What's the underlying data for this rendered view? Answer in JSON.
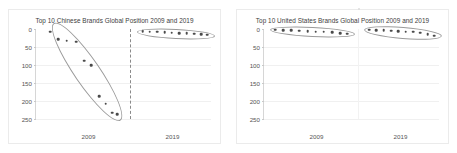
{
  "figure": {
    "background_color": "#ffffff",
    "panel_border_color": "#ebebeb",
    "point_color": "#4a4a4a",
    "ellipse_color": "#9a9a9a",
    "divider_color": "#8a8a8a"
  },
  "charts": [
    {
      "id": "chinese-brands",
      "title": "Top 10 Chinese Brands Global Position 2009 and 2019",
      "xticks": [
        "2009",
        "2019"
      ],
      "yticks": [
        "0",
        "50",
        "100",
        "150",
        "200",
        "250"
      ]
    },
    {
      "id": "united-states-brands",
      "title": "Top 10 United States Brands Global Position 2009 and 2019",
      "xticks": [
        "2009",
        "2019"
      ],
      "yticks": [
        "0",
        "50",
        "100",
        "150",
        "200",
        "250"
      ]
    }
  ],
  "chart_data": [
    {
      "type": "scatter",
      "title": "Top 10 Chinese Brands Global Position 2009 and 2019",
      "xlabel": "",
      "ylabel": "",
      "ylim": [
        0,
        250
      ],
      "y_inverted": true,
      "grid": true,
      "legend": "none",
      "categories": [
        "2009",
        "2019"
      ],
      "series": [
        {
          "name": "2009",
          "x_category": "2009",
          "values": [
            8,
            29,
            33,
            35,
            88,
            101,
            186,
            208,
            233,
            236
          ],
          "x_jitter": [
            0.1,
            0.2,
            0.3,
            0.42,
            0.52,
            0.6,
            0.7,
            0.78,
            0.86,
            0.92
          ]
        },
        {
          "name": "2019",
          "x_category": "2019",
          "values": [
            6,
            7,
            8,
            9,
            10,
            11,
            12,
            13,
            14,
            16
          ],
          "x_jitter": [
            0.08,
            0.18,
            0.28,
            0.38,
            0.48,
            0.58,
            0.68,
            0.78,
            0.88,
            0.96
          ]
        }
      ],
      "annotations": [
        {
          "kind": "ellipse",
          "label": "cluster-2009"
        },
        {
          "kind": "ellipse",
          "label": "cluster-2019"
        },
        {
          "kind": "vline-dashed",
          "label": "year-divider"
        }
      ]
    },
    {
      "type": "scatter",
      "title": "Top 10 United States Brands Global Position 2009 and 2019",
      "xlabel": "",
      "ylabel": "",
      "ylim": [
        0,
        250
      ],
      "y_inverted": true,
      "grid": true,
      "legend": "none",
      "categories": [
        "2009",
        "2019"
      ],
      "series": [
        {
          "name": "2009",
          "x_category": "2009",
          "values": [
            2,
            3,
            4,
            5,
            6,
            7,
            8,
            9,
            11,
            13
          ],
          "x_jitter": [
            0.06,
            0.16,
            0.26,
            0.36,
            0.46,
            0.56,
            0.66,
            0.76,
            0.86,
            0.95
          ]
        },
        {
          "name": "2019",
          "x_category": "2019",
          "values": [
            2,
            3,
            4,
            5,
            6,
            7,
            8,
            10,
            14,
            19
          ],
          "x_jitter": [
            0.06,
            0.16,
            0.26,
            0.36,
            0.46,
            0.56,
            0.66,
            0.76,
            0.86,
            0.95
          ]
        }
      ],
      "annotations": [
        {
          "kind": "ellipse",
          "label": "cluster-2009"
        },
        {
          "kind": "ellipse",
          "label": "cluster-2019"
        },
        {
          "kind": "vline-faint",
          "label": "year-divider"
        }
      ]
    }
  ]
}
